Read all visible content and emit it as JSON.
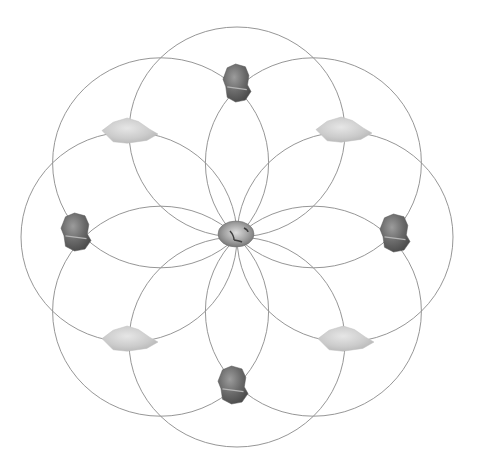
{
  "diagram": {
    "type": "crystal-grid-flower-of-life",
    "canvas": {
      "width": 482,
      "height": 467,
      "background": "#ffffff"
    },
    "center": {
      "x": 237,
      "y": 237
    },
    "circles": {
      "count": 8,
      "radius_x": 108,
      "radius_y": 105,
      "stroke": "#8a8a8a",
      "stroke_width": 0.9,
      "centers": [
        {
          "angle": 0
        },
        {
          "angle": 45
        },
        {
          "angle": 90
        },
        {
          "angle": 135
        },
        {
          "angle": 180
        },
        {
          "angle": 225
        },
        {
          "angle": 270
        },
        {
          "angle": 315
        }
      ]
    },
    "stones": [
      {
        "id": "center-stone",
        "kind": "polished-agate",
        "x": 236,
        "y": 234,
        "w": 36,
        "h": 26,
        "color": "#9a9a9a"
      },
      {
        "id": "top-stone",
        "kind": "dark-rough",
        "x": 237,
        "y": 83,
        "w": 28,
        "h": 38,
        "color": "#6b6b6b"
      },
      {
        "id": "bottom-stone",
        "kind": "dark-rough",
        "x": 233,
        "y": 385,
        "w": 30,
        "h": 38,
        "color": "#6b6b6b"
      },
      {
        "id": "left-stone",
        "kind": "dark-rough",
        "x": 76,
        "y": 232,
        "w": 30,
        "h": 38,
        "color": "#686868"
      },
      {
        "id": "right-stone",
        "kind": "dark-rough",
        "x": 395,
        "y": 233,
        "w": 30,
        "h": 38,
        "color": "#6a6a6a"
      },
      {
        "id": "upper-left-stone",
        "kind": "light-rough",
        "x": 130,
        "y": 132,
        "w": 56,
        "h": 28,
        "color": "#c9c9c9"
      },
      {
        "id": "upper-right-stone",
        "kind": "light-rough",
        "x": 344,
        "y": 131,
        "w": 56,
        "h": 28,
        "color": "#c9c9c9"
      },
      {
        "id": "lower-left-stone",
        "kind": "light-rough",
        "x": 130,
        "y": 340,
        "w": 56,
        "h": 28,
        "color": "#c9c9c9"
      },
      {
        "id": "lower-right-stone",
        "kind": "light-rough",
        "x": 346,
        "y": 340,
        "w": 56,
        "h": 28,
        "color": "#c9c9c9"
      }
    ]
  }
}
